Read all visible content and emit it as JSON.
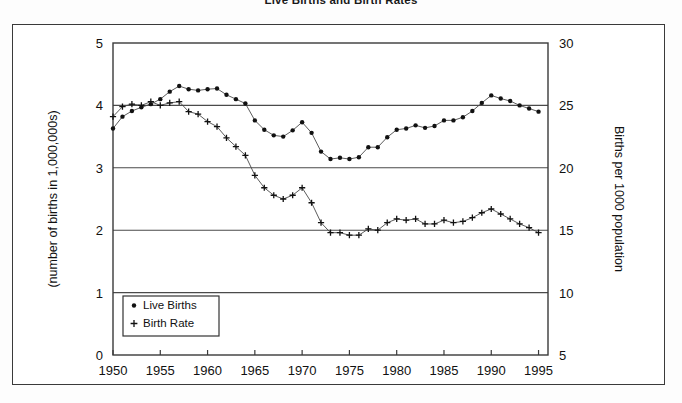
{
  "chart_data": {
    "type": "line",
    "title": "Live Births and Birth Rates",
    "xlabel": "",
    "ylabel": "(number of births in 1,000,000s)",
    "y2label": "Births per 1000 population",
    "xlim": [
      1950,
      1996
    ],
    "ylim": [
      0,
      5
    ],
    "y2lim": [
      5,
      30
    ],
    "xticks": [
      1950,
      1955,
      1960,
      1965,
      1970,
      1975,
      1980,
      1985,
      1990,
      1995
    ],
    "yticks": [
      0,
      1,
      2,
      3,
      4,
      5
    ],
    "y2ticks": [
      5,
      10,
      15,
      20,
      25,
      30
    ],
    "grid": true,
    "gridlines_y": [
      1,
      2,
      3,
      4
    ],
    "legend_position": "bottom-left",
    "x": [
      1950,
      1951,
      1952,
      1953,
      1954,
      1955,
      1956,
      1957,
      1958,
      1959,
      1960,
      1961,
      1962,
      1963,
      1964,
      1965,
      1966,
      1967,
      1968,
      1969,
      1970,
      1971,
      1972,
      1973,
      1974,
      1975,
      1976,
      1977,
      1978,
      1979,
      1980,
      1981,
      1982,
      1983,
      1984,
      1985,
      1986,
      1987,
      1988,
      1989,
      1990,
      1991,
      1992,
      1993,
      1994,
      1995
    ],
    "series": [
      {
        "name": "Live Births",
        "axis": "left",
        "marker": "dot",
        "units": "millions",
        "values": [
          3.63,
          3.82,
          3.91,
          3.97,
          4.02,
          4.1,
          4.22,
          4.31,
          4.26,
          4.24,
          4.26,
          4.27,
          4.17,
          4.1,
          4.03,
          3.76,
          3.61,
          3.52,
          3.5,
          3.6,
          3.73,
          3.56,
          3.26,
          3.14,
          3.16,
          3.14,
          3.17,
          3.33,
          3.33,
          3.49,
          3.61,
          3.63,
          3.68,
          3.64,
          3.67,
          3.76,
          3.76,
          3.81,
          3.91,
          4.04,
          4.16,
          4.11,
          4.07,
          4.0,
          3.95,
          3.9
        ]
      },
      {
        "name": "Birth Rate",
        "axis": "right",
        "marker": "plus",
        "units": "births per 1000 population",
        "values": [
          24.1,
          24.9,
          25.1,
          25.0,
          25.3,
          25.0,
          25.2,
          25.3,
          24.5,
          24.3,
          23.7,
          23.3,
          22.4,
          21.7,
          21.0,
          19.4,
          18.4,
          17.8,
          17.5,
          17.8,
          18.4,
          17.2,
          15.6,
          14.8,
          14.8,
          14.6,
          14.6,
          15.1,
          15.0,
          15.6,
          15.9,
          15.8,
          15.9,
          15.5,
          15.5,
          15.8,
          15.6,
          15.7,
          16.0,
          16.4,
          16.7,
          16.3,
          15.9,
          15.5,
          15.2,
          14.8
        ]
      }
    ],
    "final_drop_note": "Both series fall sharply at the last plotted point."
  },
  "legend": {
    "items": [
      {
        "label": "Live Births",
        "marker": "dot"
      },
      {
        "label": "Birth Rate",
        "marker": "plus"
      }
    ]
  }
}
